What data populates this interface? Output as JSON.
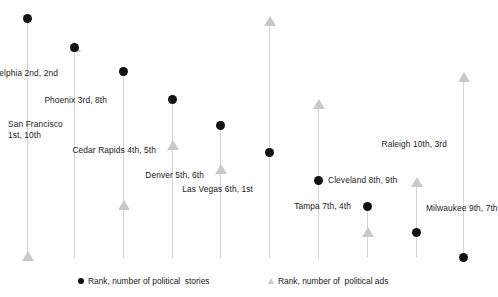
{
  "chart_data": {
    "type": "scatter",
    "title": "",
    "subtitle": "",
    "xlabel": "",
    "ylabel": "",
    "grid": false,
    "legend_position": "bottom",
    "axis_note": "Vertical drop lines per city; y-axis inverted rank (top = rank 1). No tick labels shown.",
    "categories": [
      "San Francisco",
      "Philadelphia",
      "Phoenix",
      "Cedar Rapids",
      "Denver",
      "Las Vegas",
      "Cleveland",
      "Tampa",
      "Milwaukee",
      "Raleigh"
    ],
    "series": [
      {
        "name": "Rank, number of political  stories",
        "marker": "circle",
        "color": "#111111",
        "values": [
          1,
          2,
          3,
          4,
          5,
          6,
          7,
          8,
          9,
          10
        ]
      },
      {
        "name": "Rank, number of  political ads",
        "marker": "triangle",
        "color": "#c9c9c9",
        "values": [
          10,
          2,
          8,
          5,
          6,
          1,
          9,
          4,
          7,
          3
        ]
      }
    ],
    "points": [
      {
        "city": "San Francisco",
        "label": "San Francisco\n1st, 10th",
        "stories_rank": "1st",
        "ads_rank": "10th",
        "x": 27,
        "circle_y": 18,
        "triangle_y": 256,
        "label_x": 8,
        "label_y": 119,
        "label_align": "left"
      },
      {
        "city": "Philadelphia",
        "label": "Philadelphia 2nd, 2nd",
        "stories_rank": "2nd",
        "ads_rank": "2nd",
        "x": 74,
        "circle_y": 47,
        "triangle_y": 47,
        "label_x": 58,
        "label_y": 68,
        "label_align": "right"
      },
      {
        "city": "Phoenix",
        "label": "Phoenix 3rd, 8th",
        "stories_rank": "3rd",
        "ads_rank": "8th",
        "x": 123,
        "circle_y": 71,
        "triangle_y": 205,
        "label_x": 107,
        "label_y": 95,
        "label_align": "right"
      },
      {
        "city": "Cedar Rapids",
        "label": "Cedar Rapids 4th, 5th",
        "stories_rank": "4th",
        "ads_rank": "5th",
        "x": 172,
        "circle_y": 99,
        "triangle_y": 145,
        "label_x": 156,
        "label_y": 145,
        "label_align": "right"
      },
      {
        "city": "Denver",
        "label": "Denver 5th, 6th",
        "stories_rank": "5th",
        "ads_rank": "6th",
        "x": 220,
        "circle_y": 125,
        "triangle_y": 169,
        "label_x": 204,
        "label_y": 170,
        "label_align": "right"
      },
      {
        "city": "Las Vegas",
        "label": "Las Vegas 6th, 1st",
        "stories_rank": "6th",
        "ads_rank": "1st",
        "x": 269,
        "circle_y": 152,
        "triangle_y": 21,
        "label_x": 253,
        "label_y": 184,
        "label_align": "right"
      },
      {
        "city": "Cleveland",
        "label": "Cleveland 8th, 9th",
        "stories_rank": "8th",
        "ads_rank": "9th",
        "x": 318,
        "circle_y": 180,
        "triangle_y": 104,
        "label_x": 328,
        "label_y": 175,
        "label_align": "left"
      },
      {
        "city": "Tampa",
        "label": "Tampa 7th, 4th",
        "stories_rank": "7th",
        "ads_rank": "4th",
        "x": 367,
        "circle_y": 206,
        "triangle_y": 232,
        "label_x": 351,
        "label_y": 201,
        "label_align": "right"
      },
      {
        "city": "Milwaukee",
        "label": "Milwaukee 9th, 7th",
        "stories_rank": "9th",
        "ads_rank": "7th",
        "x": 416,
        "circle_y": 232,
        "triangle_y": 182,
        "label_x": 426,
        "label_y": 203,
        "label_align": "left"
      },
      {
        "city": "Raleigh",
        "label": "Raleigh 10th, 3rd",
        "stories_rank": "10th",
        "ads_rank": "3rd",
        "x": 463,
        "circle_y": 257,
        "triangle_y": 77,
        "label_x": 447,
        "label_y": 139,
        "label_align": "right"
      }
    ],
    "columns": [
      {
        "x": 27,
        "top": 18,
        "bottom": 258
      },
      {
        "x": 74,
        "top": 44,
        "bottom": 258
      },
      {
        "x": 123,
        "top": 71,
        "bottom": 258
      },
      {
        "x": 172,
        "top": 99,
        "bottom": 258
      },
      {
        "x": 220,
        "top": 125,
        "bottom": 258
      },
      {
        "x": 269,
        "top": 19,
        "bottom": 258
      },
      {
        "x": 318,
        "top": 102,
        "bottom": 258
      },
      {
        "x": 367,
        "top": 206,
        "bottom": 258
      },
      {
        "x": 416,
        "top": 180,
        "bottom": 258
      },
      {
        "x": 463,
        "top": 75,
        "bottom": 258
      }
    ]
  },
  "legend": {
    "entries": [
      {
        "label": "Rank, number of political  stories",
        "marker": "circle",
        "x": 78,
        "y": 4
      },
      {
        "label": "Rank, number of  political ads",
        "marker": "triangle",
        "x": 268,
        "y": 4
      }
    ]
  },
  "colors": {
    "stories_marker": "#111111",
    "ads_marker": "#c9c9c9",
    "drop_line": "#d4d4d4",
    "text": "#1a1a1a",
    "background": "#ffffff"
  }
}
